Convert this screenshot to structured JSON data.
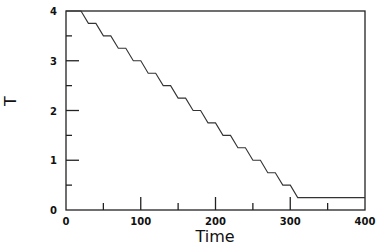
{
  "chart_data": {
    "type": "line",
    "title": "",
    "xlabel": "Time",
    "ylabel": "T",
    "xlim": [
      0,
      400
    ],
    "ylim": [
      0,
      4
    ],
    "grid": false,
    "legend": null,
    "x_ticks": [
      0,
      100,
      200,
      300,
      400
    ],
    "x_minor_ticks": [
      50,
      150,
      250,
      350
    ],
    "y_ticks": [
      0,
      1,
      2,
      3,
      4
    ],
    "y_minor_ticks": [
      0.5,
      1.5,
      2.5,
      3.5
    ],
    "series": [
      {
        "name": "T",
        "description": "Staircase cooling schedule: T starts at 4, drops by 0.25 every 20 time units (ramp over 10, hold for 10) from t=20 to t=310, then holds at 0.25 until t=400",
        "x": [
          0,
          20,
          30,
          40,
          50,
          60,
          70,
          80,
          90,
          100,
          110,
          120,
          130,
          140,
          150,
          160,
          170,
          180,
          190,
          200,
          210,
          220,
          230,
          240,
          250,
          260,
          270,
          280,
          290,
          300,
          310,
          400
        ],
        "y": [
          4,
          4,
          3.75,
          3.75,
          3.5,
          3.5,
          3.25,
          3.25,
          3.0,
          3.0,
          2.75,
          2.75,
          2.5,
          2.5,
          2.25,
          2.25,
          2.0,
          2.0,
          1.75,
          1.75,
          1.5,
          1.5,
          1.25,
          1.25,
          1.0,
          1.0,
          0.75,
          0.75,
          0.5,
          0.5,
          0.25,
          0.25
        ]
      }
    ]
  },
  "plot_area": {
    "left": 66,
    "right": 365,
    "top": 11,
    "bottom": 210
  }
}
